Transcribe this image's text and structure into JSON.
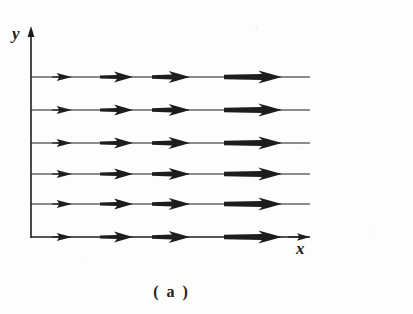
{
  "figure": {
    "caption": "( a )",
    "kind": "uniform-vector-field-diagram",
    "background_color": "#fdfdfc",
    "ink_color": "#1d1d1d"
  },
  "axes": {
    "y_label": "y",
    "x_label": "x",
    "origin": {
      "x": 31,
      "y": 237
    },
    "y_axis": {
      "x": 31,
      "top": 28,
      "bottom": 238,
      "arrow_at": "top"
    },
    "x_axis": {
      "y": 237,
      "left": 31,
      "right": 310,
      "arrow_at": "right"
    }
  },
  "chart_data": {
    "type": "scatter",
    "title": "( a )",
    "xlabel": "x",
    "ylabel": "y",
    "grid": false,
    "legend": null,
    "streamline_count": 6,
    "arrows_per_streamline": 4,
    "streamline_y": [
      77,
      110,
      143,
      174,
      204,
      237
    ],
    "line_x_start": 31,
    "line_x_end": 310,
    "arrow_columns": [
      {
        "index": 1,
        "x_start": 52,
        "x_end": 72,
        "length": 20,
        "shaft_thickness": 1.4,
        "head_length": 13,
        "head_width": 8
      },
      {
        "index": 2,
        "x_start": 100,
        "x_end": 133,
        "length": 33,
        "shaft_thickness": 4.0,
        "head_length": 16,
        "head_width": 11
      },
      {
        "index": 3,
        "x_start": 152,
        "x_end": 190,
        "length": 38,
        "shaft_thickness": 5.2,
        "head_length": 18,
        "head_width": 12
      },
      {
        "index": 4,
        "x_start": 224,
        "x_end": 282,
        "length": 58,
        "shaft_thickness": 6.0,
        "head_length": 20,
        "head_width": 13
      }
    ],
    "series": [
      {
        "name": "streamline-1",
        "y": 77,
        "values": [
          20,
          33,
          38,
          58
        ]
      },
      {
        "name": "streamline-2",
        "y": 110,
        "values": [
          20,
          33,
          38,
          58
        ]
      },
      {
        "name": "streamline-3",
        "y": 143,
        "values": [
          20,
          33,
          38,
          58
        ]
      },
      {
        "name": "streamline-4",
        "y": 174,
        "values": [
          20,
          33,
          38,
          58
        ]
      },
      {
        "name": "streamline-5",
        "y": 204,
        "values": [
          20,
          33,
          38,
          58
        ]
      },
      {
        "name": "streamline-6",
        "y": 237,
        "values": [
          20,
          33,
          38,
          58
        ]
      }
    ]
  }
}
